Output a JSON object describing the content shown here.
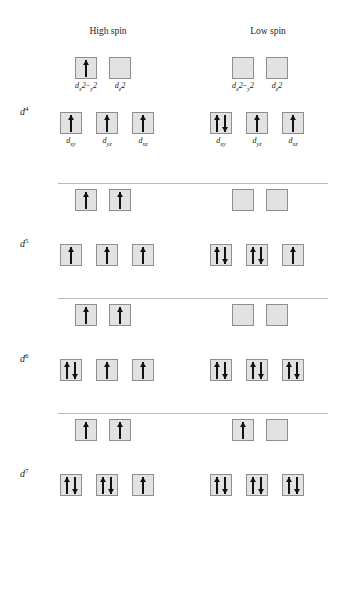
{
  "headings": {
    "high_spin": "High spin",
    "low_spin": "Low spin"
  },
  "orbital_labels": {
    "eg": [
      "d x2-y2",
      "d z2"
    ],
    "t2g": [
      "dxy",
      "dyz",
      "dxz"
    ]
  },
  "chart_data": {
    "type": "diagram",
    "columns": [
      "High spin",
      "Low spin"
    ],
    "orbital_sets": {
      "upper": {
        "name": "eg",
        "orbitals": [
          "dx2-y2",
          "dz2"
        ],
        "count": 2
      },
      "lower": {
        "name": "t2g",
        "orbitals": [
          "dxy",
          "dyz",
          "dxz"
        ],
        "count": 3
      }
    },
    "configurations": [
      {
        "label": "d4",
        "electrons": 4,
        "high_spin": {
          "upper": [
            1,
            0
          ],
          "lower": [
            1,
            1,
            1
          ]
        },
        "low_spin": {
          "upper": [
            0,
            0
          ],
          "lower": [
            2,
            1,
            1
          ]
        },
        "labeled": true
      },
      {
        "label": "d5",
        "electrons": 5,
        "high_spin": {
          "upper": [
            1,
            1
          ],
          "lower": [
            1,
            1,
            1
          ]
        },
        "low_spin": {
          "upper": [
            0,
            0
          ],
          "lower": [
            2,
            2,
            1
          ]
        },
        "labeled": false
      },
      {
        "label": "d6",
        "electrons": 6,
        "high_spin": {
          "upper": [
            1,
            1
          ],
          "lower": [
            2,
            1,
            1
          ]
        },
        "low_spin": {
          "upper": [
            0,
            0
          ],
          "lower": [
            2,
            2,
            2
          ]
        },
        "labeled": false
      },
      {
        "label": "d7",
        "electrons": 7,
        "high_spin": {
          "upper": [
            1,
            1
          ],
          "lower": [
            2,
            2,
            1
          ]
        },
        "low_spin": {
          "upper": [
            1,
            0
          ],
          "lower": [
            2,
            2,
            2
          ]
        },
        "labeled": false
      }
    ]
  },
  "colors": {
    "box_fill": "#e2e2e2",
    "box_border": "#8e8e8e",
    "arrow": "#111111",
    "divider": "#b9b9b9",
    "text": "#1a1a1a"
  }
}
